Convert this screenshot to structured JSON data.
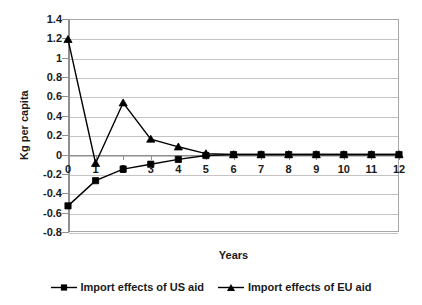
{
  "chart_data": {
    "type": "line",
    "title": "",
    "xlabel": "Years",
    "ylabel": "Kg per capita",
    "xlim": [
      0,
      12
    ],
    "ylim": [
      -0.8,
      1.4
    ],
    "ytick_step": 0.2,
    "grid": true,
    "legend_position": "bottom",
    "x": [
      0,
      1,
      2,
      3,
      4,
      5,
      6,
      7,
      8,
      9,
      10,
      11,
      12
    ],
    "xtick_labels": [
      "0",
      "1",
      "2",
      "3",
      "4",
      "5",
      "6",
      "7",
      "8",
      "9",
      "10",
      "11",
      "12"
    ],
    "ytick_labels": [
      "1.4",
      "1.2",
      "1",
      "0.8",
      "0.6",
      "0.4",
      "0.2",
      "0",
      "-0.2",
      "-0.4",
      "-0.6",
      "-0.8"
    ],
    "ytick_values": [
      1.4,
      1.2,
      1.0,
      0.8,
      0.6,
      0.4,
      0.2,
      0,
      -0.2,
      -0.4,
      -0.6,
      -0.8
    ],
    "series": [
      {
        "name": "Import effects of US aid",
        "marker": "square",
        "color": "#000000",
        "values": [
          -0.53,
          -0.27,
          -0.15,
          -0.1,
          -0.05,
          -0.01,
          0.0,
          0.0,
          0.0,
          0.0,
          0.0,
          0.0,
          0.0
        ]
      },
      {
        "name": "Import effects of EU aid",
        "marker": "triangle",
        "color": "#000000",
        "values": [
          1.19,
          -0.09,
          0.535,
          0.16,
          0.08,
          0.01,
          0.0,
          0.0,
          0.0,
          0.0,
          0.0,
          0.0,
          0.0
        ]
      }
    ]
  },
  "legend": {
    "items": [
      {
        "label": "Import effects of US aid",
        "marker": "square-marker-icon"
      },
      {
        "label": "Import effects of EU aid",
        "marker": "triangle-marker-icon"
      }
    ]
  },
  "colors": {
    "series_line": "#000000",
    "gridline": "#c4c4c4",
    "axis": "#8f8f8f",
    "frame": "#a8a8a8",
    "text": "#1a1a1a",
    "background": "#ffffff"
  }
}
